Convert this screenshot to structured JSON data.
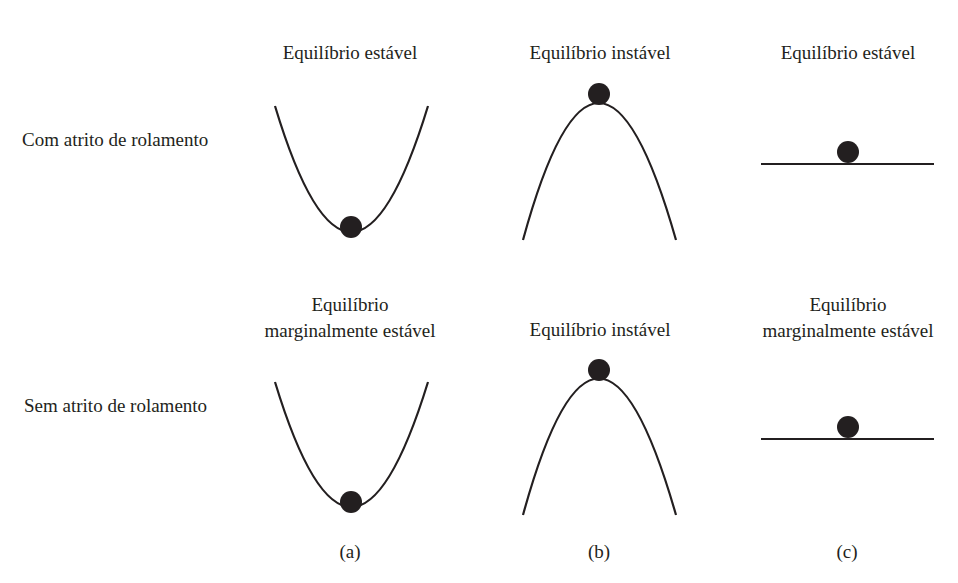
{
  "figure": {
    "rows": [
      {
        "label": "Com atrito de rolamento",
        "cells": [
          {
            "column": "a",
            "title_lines": [
              "Equilíbrio estável"
            ],
            "shape": "valley",
            "ball": "bottom"
          },
          {
            "column": "b",
            "title_lines": [
              "Equilíbrio instável"
            ],
            "shape": "hill",
            "ball": "top"
          },
          {
            "column": "c",
            "title_lines": [
              "Equilíbrio estável"
            ],
            "shape": "flat",
            "ball": "on-line"
          }
        ]
      },
      {
        "label": "Sem atrito de rolamento",
        "cells": [
          {
            "column": "a",
            "title_lines": [
              "Equilíbrio",
              "marginalmente estável"
            ],
            "shape": "valley",
            "ball": "bottom"
          },
          {
            "column": "b",
            "title_lines": [
              "Equilíbrio instável"
            ],
            "shape": "hill",
            "ball": "top"
          },
          {
            "column": "c",
            "title_lines": [
              "Equilíbrio",
              "marginalmente estável"
            ],
            "shape": "flat",
            "ball": "on-line"
          }
        ]
      }
    ],
    "column_labels": [
      "(a)",
      "(b)",
      "(c)"
    ],
    "colors": {
      "ink": "#231f20",
      "background": "#ffffff"
    }
  }
}
